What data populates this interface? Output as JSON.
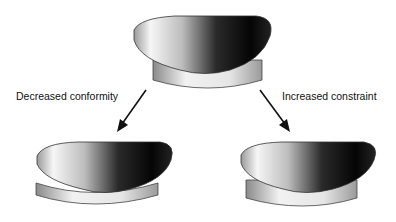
{
  "diagram": {
    "labels": {
      "left": "Decreased conformity",
      "right": "Increased constraint"
    },
    "components": [
      {
        "name": "top-component",
        "description": "femoral condyle on insert (baseline)"
      },
      {
        "name": "left-component",
        "description": "femoral condyle on flatter insert"
      },
      {
        "name": "right-component",
        "description": "femoral condyle on conforming insert"
      }
    ],
    "colors": {
      "arrow": "#111111",
      "dark": "#050505",
      "light": "#f4f4f4"
    }
  }
}
